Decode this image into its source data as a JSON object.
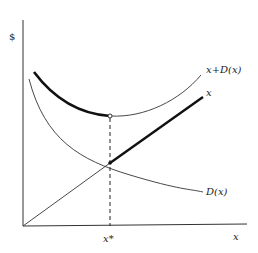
{
  "diagram": {
    "y_axis_label": "$",
    "x_axis_label": "x",
    "x_star_label": "x*",
    "curves": {
      "total": {
        "label": "x+D(x)"
      },
      "linear": {
        "label": "x"
      },
      "decreasing": {
        "label": "D(x)"
      }
    },
    "colors": {
      "line": "#222222",
      "background": "#ffffff"
    }
  }
}
